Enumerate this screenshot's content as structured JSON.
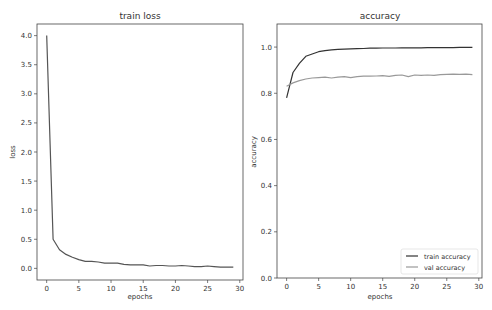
{
  "chart_data": [
    {
      "type": "line",
      "title": "train loss",
      "xlabel": "epochs",
      "ylabel": "loss",
      "xlim": [
        -1.5,
        30.5
      ],
      "ylim": [
        -0.2,
        4.2
      ],
      "xticks": [
        0,
        5,
        10,
        15,
        20,
        25,
        30
      ],
      "yticks": [
        0.0,
        0.5,
        1.0,
        1.5,
        2.0,
        2.5,
        3.0,
        3.5,
        4.0
      ],
      "ytick_labels": [
        "0.0",
        "0.5",
        "1.0",
        "1.5",
        "2.0",
        "2.5",
        "3.0",
        "3.5",
        "4.0"
      ],
      "grid": false,
      "legend": null,
      "x": [
        0,
        1,
        2,
        3,
        4,
        5,
        6,
        7,
        8,
        9,
        10,
        11,
        12,
        13,
        14,
        15,
        16,
        17,
        18,
        19,
        20,
        21,
        22,
        23,
        24,
        25,
        26,
        27,
        28,
        29
      ],
      "series": [
        {
          "name": "train loss",
          "color": "#555555",
          "values": [
            4.0,
            0.5,
            0.32,
            0.24,
            0.19,
            0.15,
            0.12,
            0.12,
            0.11,
            0.09,
            0.09,
            0.09,
            0.07,
            0.06,
            0.06,
            0.06,
            0.04,
            0.05,
            0.05,
            0.04,
            0.04,
            0.05,
            0.04,
            0.03,
            0.03,
            0.04,
            0.03,
            0.02,
            0.02,
            0.02
          ]
        }
      ]
    },
    {
      "type": "line",
      "title": "accuracy",
      "xlabel": "epochs",
      "ylabel": "accuracy",
      "xlim": [
        -1.5,
        30.5
      ],
      "ylim": [
        0.0,
        1.1
      ],
      "xticks": [
        0,
        5,
        10,
        15,
        20,
        25,
        30
      ],
      "yticks": [
        0.0,
        0.2,
        0.4,
        0.6,
        0.8,
        1.0
      ],
      "ytick_labels": [
        "0.0",
        "0.2",
        "0.4",
        "0.6",
        "0.8",
        "1.0"
      ],
      "grid": false,
      "legend": {
        "position": "lower right",
        "entries": [
          "train accuracy",
          "val accuracy"
        ]
      },
      "x": [
        0,
        1,
        2,
        3,
        4,
        5,
        6,
        7,
        8,
        9,
        10,
        11,
        12,
        13,
        14,
        15,
        16,
        17,
        18,
        19,
        20,
        21,
        22,
        23,
        24,
        25,
        26,
        27,
        28,
        29
      ],
      "series": [
        {
          "name": "train accuracy",
          "color": "#333333",
          "values": [
            0.78,
            0.89,
            0.93,
            0.96,
            0.97,
            0.98,
            0.985,
            0.988,
            0.99,
            0.991,
            0.992,
            0.993,
            0.994,
            0.995,
            0.995,
            0.996,
            0.996,
            0.996,
            0.997,
            0.997,
            0.997,
            0.997,
            0.998,
            0.998,
            0.998,
            0.998,
            0.998,
            0.999,
            0.999,
            0.999
          ]
        },
        {
          "name": "val accuracy",
          "color": "#999999",
          "values": [
            0.83,
            0.845,
            0.855,
            0.862,
            0.866,
            0.868,
            0.87,
            0.866,
            0.87,
            0.872,
            0.868,
            0.872,
            0.874,
            0.874,
            0.875,
            0.876,
            0.873,
            0.878,
            0.879,
            0.872,
            0.879,
            0.878,
            0.879,
            0.878,
            0.881,
            0.882,
            0.883,
            0.882,
            0.883,
            0.881
          ]
        }
      ]
    }
  ],
  "panels": [
    {
      "title": "train loss",
      "xlabel": "epochs",
      "ylabel": "loss"
    },
    {
      "title": "accuracy",
      "xlabel": "epochs",
      "ylabel": "accuracy",
      "legend": [
        "train accuracy",
        "val accuracy"
      ]
    }
  ]
}
